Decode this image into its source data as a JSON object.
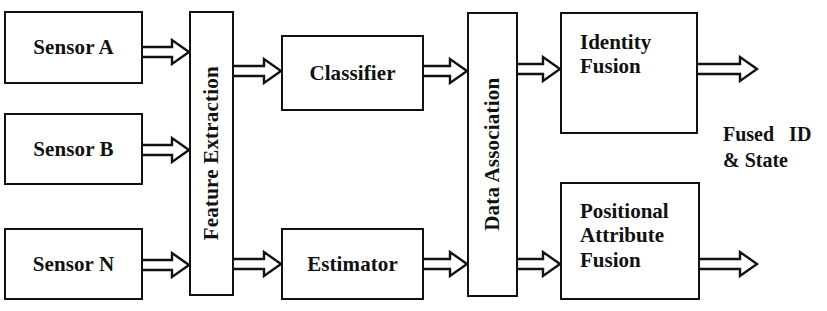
{
  "diagram": {
    "type": "block-flow-diagram",
    "canvas": {
      "width": 827,
      "height": 311,
      "background": "#ffffff"
    },
    "stroke_color": "#111111",
    "nodes": [
      {
        "id": "sensor-a",
        "label": "Sensor A",
        "x": 4,
        "y": 11,
        "w": 139,
        "h": 73,
        "orientation": "horizontal",
        "align": "center"
      },
      {
        "id": "sensor-b",
        "label": "Sensor B",
        "x": 4,
        "y": 113,
        "w": 139,
        "h": 72,
        "orientation": "horizontal",
        "align": "center"
      },
      {
        "id": "sensor-n",
        "label": "Sensor N",
        "x": 4,
        "y": 228,
        "w": 139,
        "h": 72,
        "orientation": "horizontal",
        "align": "center"
      },
      {
        "id": "feature-extraction",
        "label": "Feature Extraction",
        "x": 189,
        "y": 11,
        "w": 45,
        "h": 285,
        "orientation": "vertical",
        "align": "center"
      },
      {
        "id": "classifier",
        "label": "Classifier",
        "x": 281,
        "y": 35,
        "w": 143,
        "h": 76,
        "orientation": "horizontal",
        "align": "center"
      },
      {
        "id": "estimator",
        "label": "Estimator",
        "x": 281,
        "y": 228,
        "w": 143,
        "h": 72,
        "orientation": "horizontal",
        "align": "center"
      },
      {
        "id": "data-association",
        "label": "Data Association",
        "x": 467,
        "y": 12,
        "w": 51,
        "h": 285,
        "orientation": "vertical",
        "align": "center"
      },
      {
        "id": "identity-fusion",
        "label": "Identity\nFusion",
        "x": 560,
        "y": 12,
        "w": 138,
        "h": 122,
        "orientation": "horizontal",
        "align": "left"
      },
      {
        "id": "positional-attribute-fusion",
        "label": "Positional\nAttribute\nFusion",
        "x": 560,
        "y": 182,
        "w": 140,
        "h": 118,
        "orientation": "horizontal",
        "align": "left"
      }
    ],
    "arrows": [
      {
        "id": "arrow-sensor-a-to-feature-extraction",
        "from": "sensor-a",
        "to": "feature-extraction",
        "x1": 143,
        "x2": 189,
        "cy": 52
      },
      {
        "id": "arrow-sensor-b-to-feature-extraction",
        "from": "sensor-b",
        "to": "feature-extraction",
        "x1": 143,
        "x2": 189,
        "cy": 150
      },
      {
        "id": "arrow-sensor-n-to-feature-extraction",
        "from": "sensor-n",
        "to": "feature-extraction",
        "x1": 143,
        "x2": 189,
        "cy": 265
      },
      {
        "id": "arrow-feature-extraction-to-classifier",
        "from": "feature-extraction",
        "to": "classifier",
        "x1": 234,
        "x2": 281,
        "cy": 71
      },
      {
        "id": "arrow-feature-extraction-to-estimator",
        "from": "feature-extraction",
        "to": "estimator",
        "x1": 234,
        "x2": 281,
        "cy": 264
      },
      {
        "id": "arrow-classifier-to-data-association",
        "from": "classifier",
        "to": "data-association",
        "x1": 424,
        "x2": 467,
        "cy": 71
      },
      {
        "id": "arrow-estimator-to-data-association",
        "from": "estimator",
        "to": "data-association",
        "x1": 424,
        "x2": 467,
        "cy": 264
      },
      {
        "id": "arrow-data-association-to-identity-fusion",
        "from": "data-association",
        "to": "identity-fusion",
        "x1": 518,
        "x2": 560,
        "cy": 69
      },
      {
        "id": "arrow-data-association-to-positional-attribute-fusion",
        "from": "data-association",
        "to": "positional-attribute-fusion",
        "x1": 518,
        "x2": 560,
        "cy": 264
      },
      {
        "id": "arrow-identity-fusion-output",
        "from": "identity-fusion",
        "to": "fused-output",
        "x1": 698,
        "x2": 757,
        "cy": 69
      },
      {
        "id": "arrow-positional-attribute-fusion-output",
        "from": "positional-attribute-fusion",
        "to": "fused-output",
        "x1": 700,
        "x2": 757,
        "cy": 264
      }
    ],
    "annotations": [
      {
        "id": "fused-output-label",
        "text": "Fused   ID\n& State",
        "x": 723,
        "y": 122
      }
    ]
  }
}
